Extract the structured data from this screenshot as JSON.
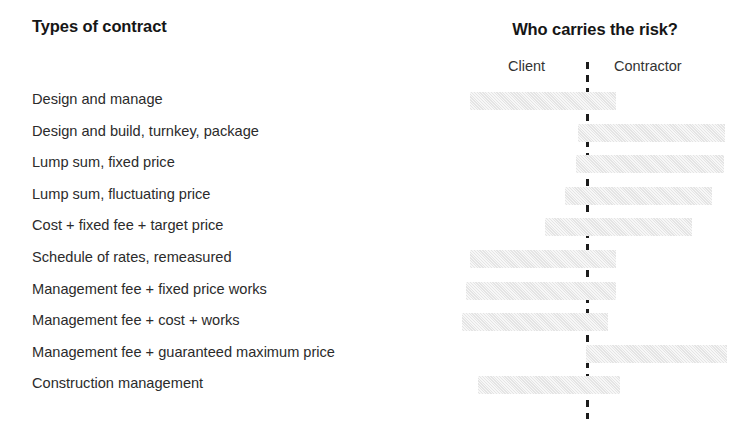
{
  "headers": {
    "left_title": "Types of contract",
    "right_title": "Who carries the risk?",
    "client_label": "Client",
    "contractor_label": "Contractor"
  },
  "colors": {
    "bar_fill": "#e9e9e9",
    "divider": "#1c1c1c",
    "text": "#2b2b2b",
    "background": "#ffffff"
  },
  "chart_data": {
    "type": "bar",
    "title": "Who carries the risk?",
    "xlabel": "",
    "ylabel": "Types of contract",
    "orientation": "horizontal",
    "grid": false,
    "legend": [
      "Client",
      "Contractor"
    ],
    "legend_position": "top",
    "axis_note": "Floating horizontal bars spanning a risk continuum; dashed line marks the 50/50 split between Client and Contractor risk.",
    "xlim": [
      0,
      100
    ],
    "divider_at": 50,
    "categories": [
      "Design and manage",
      "Design and build, turnkey, package",
      "Lump sum, fixed price",
      "Lump sum, fluctuating price",
      "Cost + fixed fee + target price",
      "Schedule of rates, remeasured",
      "Management fee + fixed price works",
      "Management fee + cost + works",
      "Management fee + guaranteed maximum price",
      "Construction management"
    ],
    "bars": [
      {
        "label": "Design and manage",
        "start": 9.5,
        "end": 65.5,
        "risk_carrier": "mostly-client"
      },
      {
        "label": "Design and build, turnkey, package",
        "start": 50.8,
        "end": 108.0,
        "risk_carrier": "contractor"
      },
      {
        "label": "Lump sum, fixed price",
        "start": 50.0,
        "end": 107.5,
        "risk_carrier": "contractor"
      },
      {
        "label": "Lump sum, fluctuating price",
        "start": 45.5,
        "end": 103.0,
        "risk_carrier": "contractor"
      },
      {
        "label": "Cost + fixed fee + target price",
        "start": 37.5,
        "end": 95.5,
        "risk_carrier": "balanced-contractor"
      },
      {
        "label": "Schedule of rates, remeasured",
        "start": 9.5,
        "end": 65.5,
        "risk_carrier": "mostly-client"
      },
      {
        "label": "Management fee + fixed price works",
        "start": 8.0,
        "end": 65.5,
        "risk_carrier": "mostly-client"
      },
      {
        "label": "Management fee + cost + works",
        "start": 6.0,
        "end": 62.0,
        "risk_carrier": "client"
      },
      {
        "label": "Management fee + guaranteed maximum price",
        "start": 51.0,
        "end": 108.5,
        "risk_carrier": "contractor"
      },
      {
        "label": "Construction management",
        "start": 12.5,
        "end": 68.5,
        "risk_carrier": "mostly-client"
      }
    ],
    "px_geometry": {
      "divider_x": 587,
      "bar_height": 18,
      "row_pitch": 31.6,
      "first_bar_top": 92,
      "bar_px": [
        {
          "left": 470,
          "right": 616
        },
        {
          "left": 578,
          "right": 725
        },
        {
          "left": 576,
          "right": 724
        },
        {
          "left": 565,
          "right": 712
        },
        {
          "left": 545,
          "right": 692
        },
        {
          "left": 470,
          "right": 616
        },
        {
          "left": 466,
          "right": 616
        },
        {
          "left": 462,
          "right": 608
        },
        {
          "left": 586,
          "right": 727
        },
        {
          "left": 478,
          "right": 620
        }
      ]
    }
  }
}
